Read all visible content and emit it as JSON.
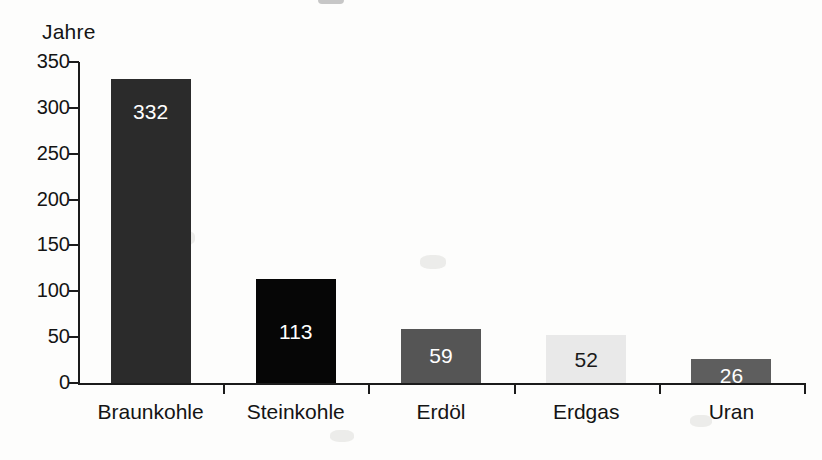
{
  "chart_data": {
    "type": "bar",
    "title": "",
    "xlabel": "",
    "ylabel": "Jahre",
    "categories": [
      "Braunkohle",
      "Steinkohle",
      "Erdöl",
      "Erdgas",
      "Uran"
    ],
    "values": [
      332,
      113,
      59,
      52,
      26
    ],
    "value_labels": [
      "332",
      "113",
      "59",
      "52",
      "26"
    ],
    "ylim": [
      0,
      350
    ],
    "ytick_labels": [
      "0",
      "50",
      "100",
      "150",
      "200",
      "250",
      "300",
      "350"
    ],
    "ytick_values": [
      0,
      50,
      100,
      150,
      200,
      250,
      300,
      350
    ],
    "grid": false,
    "legend": false,
    "bar_colors": [
      "#2b2b2b",
      "#060606",
      "#555555",
      "#e9e9e9",
      "#5e5e5e"
    ],
    "bar_label_colors": [
      "#ffffff",
      "#ffffff",
      "#ffffff",
      "#1a1a1a",
      "#ffffff"
    ],
    "axis_color": "#1b1b1b",
    "background": "#fdfdfc"
  }
}
